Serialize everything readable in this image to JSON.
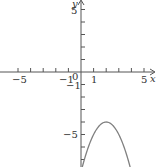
{
  "chart_data": {
    "type": "line",
    "title": "",
    "xlabel": "x",
    "ylabel": "y",
    "xlim": [
      -6.4,
      6.2
    ],
    "ylim": [
      -7.6,
      5.8
    ],
    "grid": false,
    "x_ticks": [
      -5,
      -4,
      -3,
      -2,
      -1,
      1,
      2,
      3,
      4,
      5
    ],
    "y_ticks": [
      5,
      4,
      3,
      2,
      1,
      -1,
      -2,
      -3,
      -4,
      -5,
      -6,
      -7
    ],
    "tick_labels": {
      "x": [
        {
          "value": -5,
          "text": "−5"
        },
        {
          "value": -1,
          "text": "−1"
        },
        {
          "value": 1,
          "text": "1"
        },
        {
          "value": 5,
          "text": "5"
        }
      ],
      "y": [
        {
          "value": 5,
          "text": "5"
        },
        {
          "value": -1,
          "text": "−1"
        },
        {
          "value": -5,
          "text": "−5"
        }
      ],
      "origin": "0"
    },
    "series": [
      {
        "name": "y = -(x-2)^2 - 4",
        "function": "-(x-2)^2-4",
        "x": [
          0,
          0.5,
          1,
          1.5,
          2,
          2.5,
          3,
          3.5,
          4
        ],
        "y": [
          -8,
          -6.25,
          -5,
          -4.25,
          -4,
          -4.25,
          -5,
          -6.25,
          -8
        ],
        "vertex": [
          2,
          -4
        ],
        "color": "#808080"
      }
    ]
  },
  "labels": {
    "x_axis": "x",
    "y_axis": "y",
    "origin": "0",
    "x_neg5": "−5",
    "x_neg1": "−1",
    "x_pos1": "1",
    "x_pos5": "5",
    "y_pos5": "5",
    "y_neg1": "−1",
    "y_neg5": "−5"
  },
  "colors": {
    "axis": "#555555",
    "curve": "#808080",
    "text": "#333333"
  }
}
